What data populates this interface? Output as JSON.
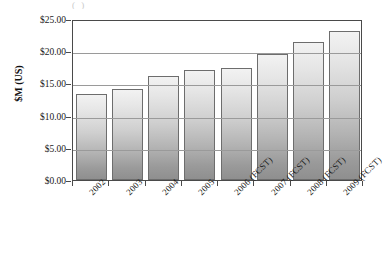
{
  "chart_data": {
    "type": "bar",
    "title": "",
    "xlabel": "",
    "ylabel": "$M (US)",
    "categories": [
      "2002",
      "2003",
      "2004",
      "2005",
      "2006 (FCST)",
      "2007 (FCST)",
      "2008 (FCST)",
      "2009 (FCST)"
    ],
    "values": [
      13.4,
      14.2,
      16.1,
      17.1,
      17.4,
      19.5,
      21.4,
      23.1
    ],
    "ylim": [
      0,
      25
    ],
    "ytick_values": [
      0,
      5,
      10,
      15,
      20,
      25
    ],
    "ytick_labels": [
      "$0.00",
      "$5.00",
      "$10.00",
      "$15.00",
      "$20.00",
      "$25.00"
    ],
    "grid": true,
    "legend": "none",
    "bar_fill": "#cfcfcf",
    "bar_edge": "#6d6d6d",
    "axis_color": "#4a4a4a",
    "grid_color": "#9a9a9a",
    "background": "#ffffff"
  },
  "title_remnant": "( )"
}
